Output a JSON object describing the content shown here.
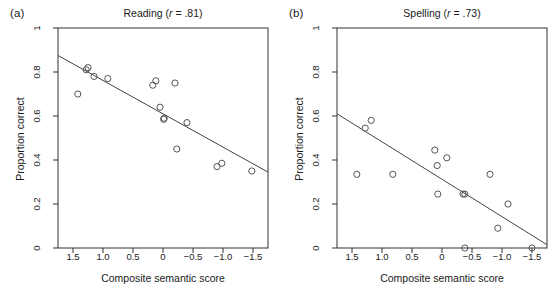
{
  "figure": {
    "width": 558,
    "height": 300,
    "background": "#ffffff",
    "marker_color": "#555555",
    "line_color": "#444444",
    "axis_color": "#333333"
  },
  "panels": [
    {
      "key": "a",
      "label": "(a)",
      "title_main": "Reading (",
      "title_stat_symbol": "r",
      "title_tail": " = .81)",
      "title_full": "Reading (r = .81)"
    },
    {
      "key": "b",
      "label": "(b)",
      "title_main": "Spelling (",
      "title_stat_symbol": "r",
      "title_tail": " = .73)",
      "title_full": "Spelling (r = .73)"
    }
  ],
  "chart_data": [
    {
      "type": "scatter",
      "panel": "a",
      "title": "Reading (r = .81)",
      "xlabel": "Composite semantic score",
      "ylabel": "Proportion correct",
      "correlation_r": 0.81,
      "xlim": [
        1.75,
        -1.75
      ],
      "ylim": [
        0,
        1
      ],
      "x_reversed": true,
      "grid": false,
      "legend": "none",
      "xticks": [
        1.5,
        1.0,
        0.5,
        0,
        -0.5,
        -1.0,
        -1.5
      ],
      "xticklabels": [
        "1.5",
        "1.0",
        "0.5",
        "0",
        "−0.5",
        "−1.0",
        "−1.5"
      ],
      "yticks": [
        0,
        0.2,
        0.4,
        0.6,
        0.8,
        1
      ],
      "yticklabels": [
        "0",
        "0.2",
        "0.4",
        "0.6",
        "0.8",
        "1"
      ],
      "points": [
        {
          "x": 1.42,
          "y": 0.7
        },
        {
          "x": 1.28,
          "y": 0.81
        },
        {
          "x": 1.25,
          "y": 0.82
        },
        {
          "x": 1.15,
          "y": 0.78
        },
        {
          "x": 0.92,
          "y": 0.77
        },
        {
          "x": 0.12,
          "y": 0.76
        },
        {
          "x": 0.17,
          "y": 0.74
        },
        {
          "x": -0.2,
          "y": 0.75
        },
        {
          "x": 0.05,
          "y": 0.64
        },
        {
          "x": -0.02,
          "y": 0.59
        },
        {
          "x": -0.01,
          "y": 0.585
        },
        {
          "x": -0.4,
          "y": 0.57
        },
        {
          "x": -0.23,
          "y": 0.45
        },
        {
          "x": -0.9,
          "y": 0.37
        },
        {
          "x": -0.98,
          "y": 0.385
        },
        {
          "x": -1.48,
          "y": 0.35
        }
      ],
      "regression_line": {
        "x_start": 1.75,
        "y_start": 0.875,
        "x_end": -1.75,
        "y_end": 0.345
      }
    },
    {
      "type": "scatter",
      "panel": "b",
      "title": "Spelling (r = .73)",
      "xlabel": "Composite semantic score",
      "ylabel": "Proportion correct",
      "correlation_r": 0.73,
      "xlim": [
        1.75,
        -1.75
      ],
      "ylim": [
        0,
        1
      ],
      "x_reversed": true,
      "grid": false,
      "legend": "none",
      "xticks": [
        1.5,
        1.0,
        0.5,
        0,
        -0.5,
        -1.0,
        -1.5
      ],
      "xticklabels": [
        "1.5",
        "1.0",
        "0.5",
        "0",
        "−0.5",
        "−1.0",
        "−1.5"
      ],
      "yticks": [
        0,
        0.2,
        0.4,
        0.6,
        0.8,
        1
      ],
      "yticklabels": [
        "0",
        "0.2",
        "0.4",
        "0.6",
        "0.8",
        "1"
      ],
      "points": [
        {
          "x": 1.42,
          "y": 0.335
        },
        {
          "x": 1.28,
          "y": 0.545
        },
        {
          "x": 1.18,
          "y": 0.58
        },
        {
          "x": 0.82,
          "y": 0.335
        },
        {
          "x": 0.12,
          "y": 0.445
        },
        {
          "x": 0.08,
          "y": 0.375
        },
        {
          "x": -0.08,
          "y": 0.41
        },
        {
          "x": 0.07,
          "y": 0.245
        },
        {
          "x": -0.35,
          "y": 0.245
        },
        {
          "x": -0.38,
          "y": 0.245
        },
        {
          "x": -0.8,
          "y": 0.335
        },
        {
          "x": -1.1,
          "y": 0.2
        },
        {
          "x": -0.93,
          "y": 0.09
        },
        {
          "x": -0.38,
          "y": 0.0
        },
        {
          "x": -1.5,
          "y": 0.0
        }
      ],
      "regression_line": {
        "x_start": 1.75,
        "y_start": 0.61,
        "x_end": -1.75,
        "y_end": 0.015
      }
    }
  ]
}
